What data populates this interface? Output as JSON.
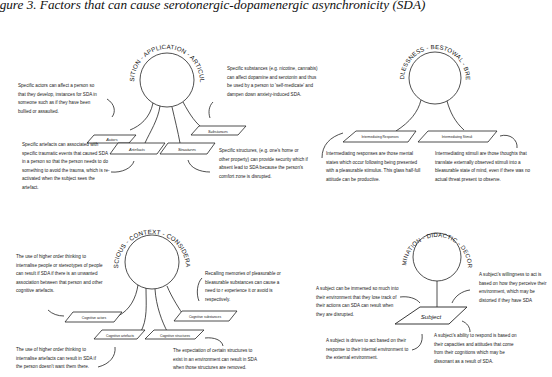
{
  "title": "igure 3. Factors that can cause serotonergic-dopamenergic asynchronicity (SDA)",
  "diagrams": [
    {
      "ring_label": "ACQUISITION - APPLICATION - ARTICULATION",
      "boxes": [
        "Actors",
        "Artefacts",
        "Structures",
        "Substances"
      ],
      "notes": {
        "actors": "Specific actors can affect a person so that they develop, instances for SDA in someone such as if they have been bullied or assaulted.",
        "artefacts": "Specific artefacts can associated with specific traumatic events that caused SDA in a person so that the person needs to do something to avoid the trauma, which is re-activated when the subject sees the artefact.",
        "substances": "Specific substances (e.g. nicotine, cannabis) can affect dopamine and serotonin and thus be used by a person to 'self-medicate' and dampen down anxiety-induced SDA.",
        "structures": "Specific structures, (e.g. one's home or other property) can provide security which if absent lead to SDA because the person's comfort zone is disrupted."
      }
    },
    {
      "ring_label": "BOUNDLESSNESS - BESTOWAL - BREADTH",
      "boxes": [
        "Intermediating Responses",
        "Intermediating Stimuli"
      ],
      "notes": {
        "responses": "Intermediating responses are those mental states which occur following being presented with a pleasurable stimulus. This glass half-full attitude can be productive.",
        "stimuli": "Intermediating stimuli are those thoughts that translate externally observed stimuli into a bleasurable state of mind, even if there was no actual threat present to observe."
      }
    },
    {
      "ring_label": "CONSCIOUS - CONTEXT - CONSIDERATION",
      "boxes": [
        "Cognitive actors",
        "Cognitive artefacts",
        "Cognitive structures",
        "Cognitive substances"
      ],
      "notes": {
        "actors": "The use of higher order thinking to internalise people or stereotypes of people can result if SDA if there is an unwanted association between that person and other cognitive artefacts.",
        "artefacts": "The use of higher order thinking to internalise artefacts can result in SDA if the person doesn't want them there.",
        "substances": "Recalling memories of pleasurable or bleasurable substances can cause a need to r experience it or avoid is respectively.",
        "structures": "The expectation of certain structures to exist in an environment can result in SDA when those structures are removed."
      }
    },
    {
      "ring_label": "DETERMINATION - DIDACTIC - DECORATION",
      "boxes": [
        "Subject"
      ],
      "notes": {
        "immersed": "A subject can be immersed so much into their environment that they lose track of their actions can SDA can result when they are disrupted.",
        "willingness": "A subject's willingness to act is based on how they perceive their environment, which may be distorted if they have SDA",
        "driven": "A subject is driven to act based on their response to their internal environment to the external environment.",
        "ability": "A subject's ability to respond is based on their capacities and attitudes that come from their cognitions which may be dissonant as a result of SDA."
      }
    }
  ]
}
